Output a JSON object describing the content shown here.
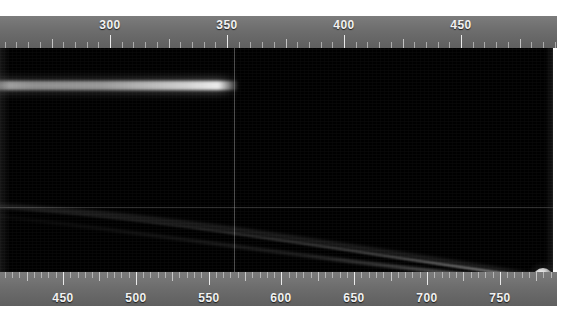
{
  "view": {
    "title": "Grayscale measurement image with dual scale rulers",
    "background_color": "#ffffff",
    "image_background_color": "#000000"
  },
  "top_ruler": {
    "name": "top-scale-ruler",
    "units_per_major": 50,
    "units_per_minor": 5,
    "pixels_per_major": 117,
    "range_start": 267,
    "range_end": 505,
    "labels": [
      {
        "value": "300",
        "x": 110
      },
      {
        "value": "350",
        "x": 227
      },
      {
        "value": "400",
        "x": 344
      },
      {
        "value": "450",
        "x": 461
      }
    ]
  },
  "bottom_ruler": {
    "name": "bottom-scale-ruler",
    "units_per_major": 50,
    "units_per_minor": 5,
    "pixels_per_major": 72.8,
    "range_start": 407,
    "range_end": 789,
    "labels": [
      {
        "value": "450",
        "x": 63
      },
      {
        "value": "500",
        "x": 136
      },
      {
        "value": "550",
        "x": 209
      },
      {
        "value": "600",
        "x": 281
      },
      {
        "value": "650",
        "x": 354
      },
      {
        "value": "700",
        "x": 427
      },
      {
        "value": "750",
        "x": 500
      }
    ]
  },
  "image_features": {
    "horizontal_streak": {
      "label": "bright-horizontal-streak",
      "x_start": 0,
      "x_end": 233,
      "y": 37
    },
    "vertical_marker": {
      "label": "vertical-reference-line",
      "x": 234
    },
    "horizontal_marker": {
      "label": "horizontal-reference-line",
      "y": 159
    },
    "bright_blob": {
      "label": "bright-round-object",
      "x": 543,
      "y": 230,
      "radius": 10
    },
    "curved_arc": {
      "label": "faint-curved-arc-trail"
    }
  },
  "colors": {
    "ruler_face": "#6e6e6e",
    "ruler_tick": "#d8d8d8",
    "ruler_text": "#f2f2f2",
    "image_bg": "#000000",
    "highlight": "#fdfdfd"
  }
}
